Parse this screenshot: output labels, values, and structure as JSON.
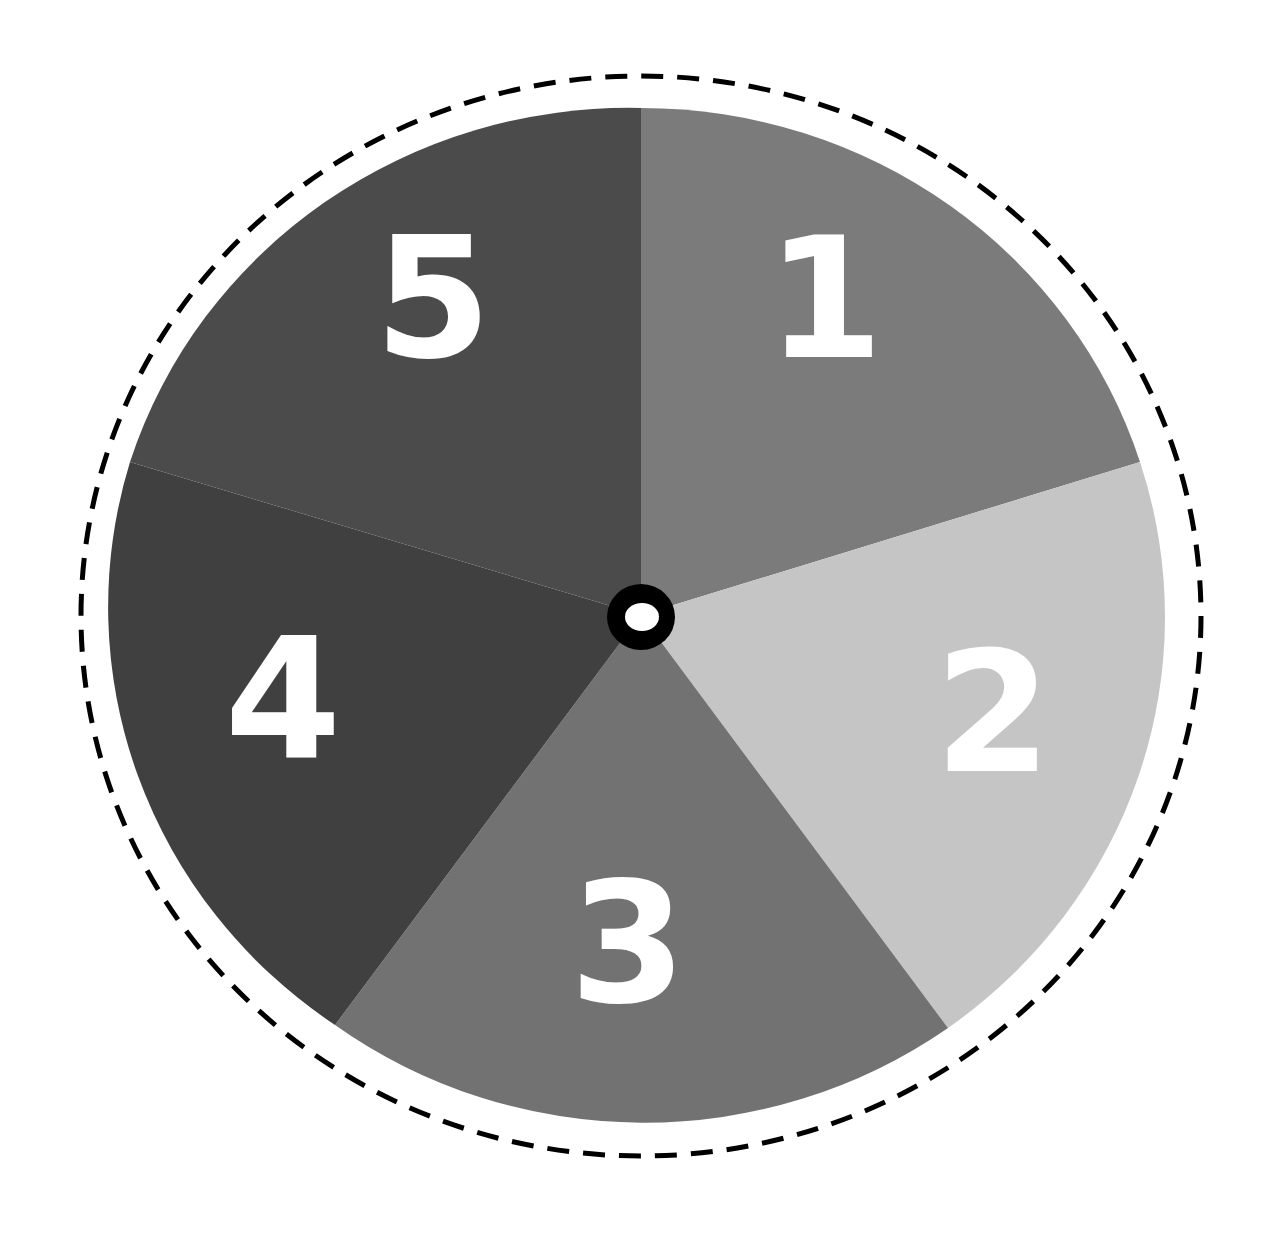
{
  "spinner": {
    "sections": [
      {
        "label": "1",
        "color": "#7b7b7b"
      },
      {
        "label": "2",
        "color": "#c5c5c5"
      },
      {
        "label": "3",
        "color": "#727272"
      },
      {
        "label": "4",
        "color": "#404040"
      },
      {
        "label": "5",
        "color": "#4b4b4b"
      }
    ],
    "outline_style": "dashed",
    "outline_color": "#000000",
    "hub_ring_color": "#000000",
    "hub_center_color": "#ffffff",
    "background": "#ffffff"
  }
}
